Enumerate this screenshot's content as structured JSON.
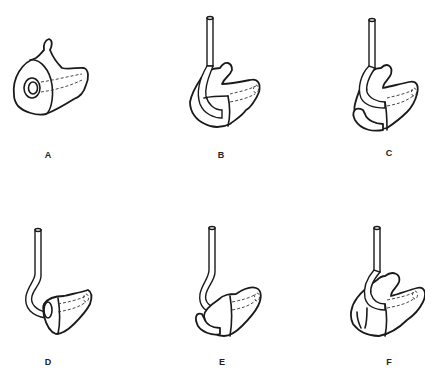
{
  "figure": {
    "panels": [
      {
        "id": "A",
        "label": "A",
        "description": "earmold body with sound bore opening, no tubing"
      },
      {
        "id": "B",
        "label": "B",
        "description": "earmold with tubing, helix lock and canal lock"
      },
      {
        "id": "C",
        "label": "C",
        "description": "earmold with tubing and extended canal lock hook"
      },
      {
        "id": "D",
        "label": "D",
        "description": "canal earmold with curved tubing"
      },
      {
        "id": "E",
        "label": "E",
        "description": "canal earmold with tubing and concha hook"
      },
      {
        "id": "F",
        "label": "F",
        "description": "full shell earmold with tubing"
      }
    ],
    "colors": {
      "line": "#1a1a1a",
      "background": "#ffffff"
    }
  }
}
